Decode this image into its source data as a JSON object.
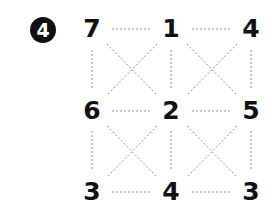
{
  "puzzle": {
    "number": "4",
    "grid": [
      [
        "7",
        "1",
        "4"
      ],
      [
        "6",
        "2",
        "5"
      ],
      [
        "3",
        "4",
        "3"
      ]
    ]
  },
  "colors": {
    "text": "#111111",
    "line": "#999999",
    "background": "#ffffff"
  }
}
